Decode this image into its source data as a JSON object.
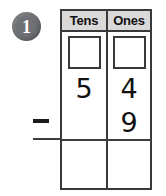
{
  "problem": {
    "number": "1",
    "operator": "−",
    "badge_color": "#6f7073",
    "ink_color": "#111111",
    "header_fill": "#d9d9d9"
  },
  "table": {
    "columns": [
      {
        "key": "tens",
        "label": "Tens"
      },
      {
        "key": "ones",
        "label": "Ones"
      }
    ],
    "regroup_row": {
      "tens": "",
      "ones": ""
    },
    "minuend": {
      "tens": "5",
      "ones": "4"
    },
    "subtrahend": {
      "tens": "",
      "ones": "9"
    },
    "answer": {
      "tens": "",
      "ones": ""
    }
  }
}
